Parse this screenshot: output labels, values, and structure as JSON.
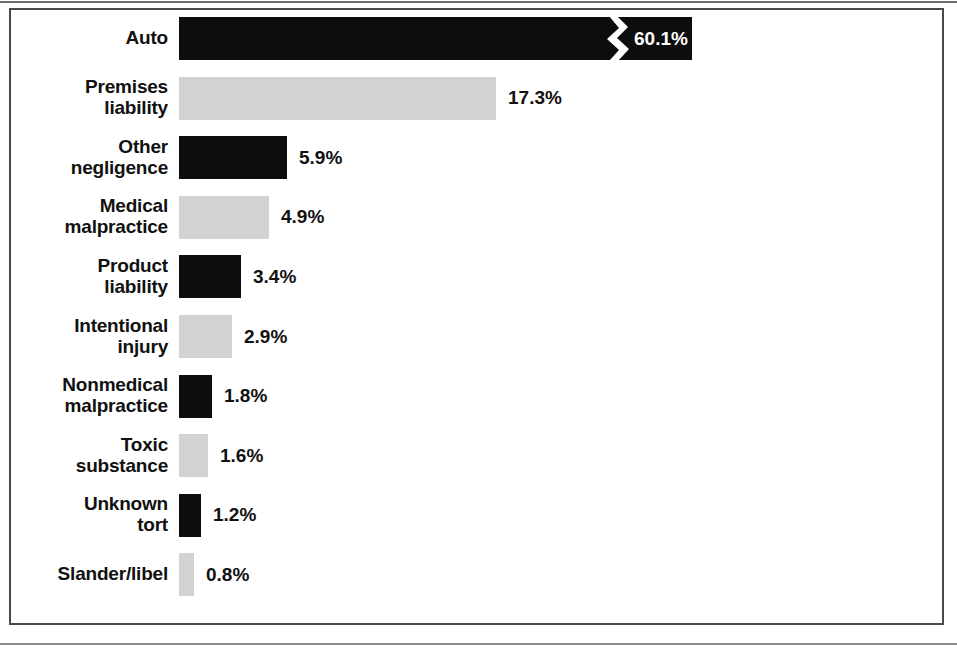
{
  "chart_data": {
    "type": "bar",
    "orientation": "horizontal",
    "title": "",
    "subtitle": "",
    "xlabel": "",
    "ylabel": "",
    "grid": false,
    "legend": null,
    "axis_break": {
      "present": true,
      "series_index": 0,
      "note": "zigzag break on the Auto bar; bar is truncated so 60.1% fits the panel"
    },
    "value_suffix": "%",
    "categories": [
      "Auto",
      "Premises liability",
      "Other negligence",
      "Medical malpractice",
      "Product liability",
      "Intentional injury",
      "Nonmedical malpractice",
      "Toxic substance",
      "Unknown tort",
      "Slander/libel"
    ],
    "values": [
      60.1,
      17.3,
      5.9,
      4.9,
      3.4,
      2.9,
      1.8,
      1.6,
      1.2,
      0.8
    ],
    "value_labels": [
      "60.1%",
      "17.3%",
      "5.9%",
      "4.9%",
      "3.4%",
      "2.9%",
      "1.8%",
      "1.6%",
      "1.2%",
      "0.8%"
    ],
    "xlim": [
      0,
      60.1
    ],
    "colors": {
      "dark": "#0d0d0d",
      "light": "#d2d2d2",
      "label_text": "#111111",
      "inside_label_text": "#ffffff",
      "frame": "#4a4a4a",
      "background": "#ffffff"
    }
  },
  "rows": [
    {
      "label_lines": [
        "Auto"
      ],
      "value_label": "60.1%",
      "value": 60.1,
      "fill": "dark",
      "label_inside": true
    },
    {
      "label_lines": [
        "Premises",
        "liability"
      ],
      "value_label": "17.3%",
      "value": 17.3,
      "fill": "light",
      "label_inside": false
    },
    {
      "label_lines": [
        "Other",
        "negligence"
      ],
      "value_label": "5.9%",
      "value": 5.9,
      "fill": "dark",
      "label_inside": false
    },
    {
      "label_lines": [
        "Medical",
        "malpractice"
      ],
      "value_label": "4.9%",
      "value": 4.9,
      "fill": "light",
      "label_inside": false
    },
    {
      "label_lines": [
        "Product",
        "liability"
      ],
      "value_label": "3.4%",
      "value": 3.4,
      "fill": "dark",
      "label_inside": false
    },
    {
      "label_lines": [
        "Intentional",
        "injury"
      ],
      "value_label": "2.9%",
      "value": 2.9,
      "fill": "light",
      "label_inside": false
    },
    {
      "label_lines": [
        "Nonmedical",
        "malpractice"
      ],
      "value_label": "1.8%",
      "value": 1.8,
      "fill": "dark",
      "label_inside": false
    },
    {
      "label_lines": [
        "Toxic",
        "substance"
      ],
      "value_label": "1.6%",
      "value": 1.6,
      "fill": "light",
      "label_inside": false
    },
    {
      "label_lines": [
        "Unknown",
        "tort"
      ],
      "value_label": "1.2%",
      "value": 1.2,
      "fill": "dark",
      "label_inside": false
    },
    {
      "label_lines": [
        "Slander/libel"
      ],
      "value_label": "0.8%",
      "value": 0.8,
      "fill": "light",
      "label_inside": false
    }
  ]
}
